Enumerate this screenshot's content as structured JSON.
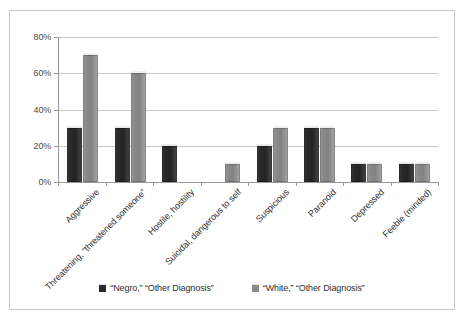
{
  "chart_data": {
    "type": "bar",
    "title": "",
    "subtitle": "",
    "xlabel": "",
    "ylabel": "",
    "ylim": [
      0,
      80
    ],
    "ytick_labels": [
      "0%",
      "20%",
      "40%",
      "60%",
      "80%"
    ],
    "ytick_values": [
      0,
      20,
      40,
      60,
      80
    ],
    "grid": true,
    "legend_position": "bottom",
    "categories": [
      "Aggressive",
      "Threatening, “threatened someone”",
      "Hostile, hostility",
      "Suicidal, dangerous to self",
      "Suspicious",
      "Paranoid",
      "Depressed",
      "Feeble (minded)"
    ],
    "series": [
      {
        "name": "“Negro,” “Other Diagnosis”",
        "color": "#2a2a2a",
        "values": [
          30,
          30,
          20,
          0,
          20,
          30,
          10,
          10
        ]
      },
      {
        "name": "“White,” “Other Diagnosis”",
        "color": "#8a8a8a",
        "values": [
          70,
          60,
          0,
          10,
          30,
          30,
          10,
          10
        ]
      }
    ]
  },
  "legend": {
    "entries": [
      {
        "label": "“Negro,” “Other Diagnosis”",
        "swatch": "dark-square-swatch"
      },
      {
        "label": "“White,” “Other Diagnosis”",
        "swatch": "light-square-swatch"
      }
    ]
  },
  "colors": {
    "series_dark": "#2a2a2a",
    "series_light": "#8a8a8a",
    "gridline": "#c9c9c9",
    "axis": "#9a9a9a",
    "frame_border": "#c8c8c8",
    "text": "#2e2e2e",
    "background": "#ffffff"
  }
}
